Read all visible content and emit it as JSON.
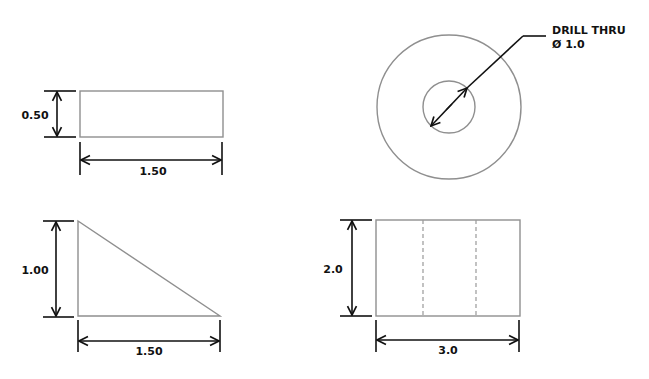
{
  "drawing": {
    "colors": {
      "background": "#ffffff",
      "part_outline": "#8f8f8f",
      "dimension": "#111111",
      "hidden_line": "#999999"
    },
    "views": [
      {
        "id": "top-left-rectangle",
        "shape": "rectangle",
        "dimensions": {
          "height": "0.50",
          "width": "1.50"
        }
      },
      {
        "id": "top-right-circle",
        "shape": "concentric-circles",
        "callout": {
          "line1": "DRILL THRU",
          "line2": "Ø 1.0"
        }
      },
      {
        "id": "bottom-left-triangle",
        "shape": "right-triangle",
        "dimensions": {
          "height": "1.00",
          "width": "1.50"
        }
      },
      {
        "id": "bottom-right-rectangle",
        "shape": "rectangle-with-hidden-lines",
        "dimensions": {
          "height": "2.0",
          "width": "3.0"
        }
      }
    ]
  }
}
